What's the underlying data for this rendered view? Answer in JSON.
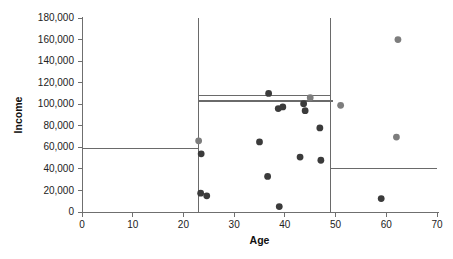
{
  "chart_data": {
    "type": "scatter",
    "title": "",
    "xlabel": "Age",
    "ylabel": "Income",
    "xlim": [
      0,
      70
    ],
    "ylim": [
      0,
      180000
    ],
    "xticks": [
      0,
      10,
      20,
      30,
      40,
      50,
      60,
      70
    ],
    "xticklabels": [
      "0",
      "10",
      "20",
      "30",
      "40",
      "50",
      "60",
      "70"
    ],
    "yticks": [
      0,
      20000,
      40000,
      60000,
      80000,
      100000,
      120000,
      140000,
      160000,
      180000
    ],
    "yticklabels": [
      "0",
      "20,000",
      "40,000",
      "60,000",
      "80,000",
      "100,000",
      "120,000",
      "140,000",
      "160,000",
      "180,000"
    ],
    "grid": false,
    "legend": null,
    "series": [
      {
        "name": "dark-points",
        "color": "#3b3b3b",
        "marker": "circle",
        "points": [
          {
            "x": 23.5,
            "y": 54000
          },
          {
            "x": 23.4,
            "y": 17500
          },
          {
            "x": 24.6,
            "y": 15000
          },
          {
            "x": 35.0,
            "y": 65000
          },
          {
            "x": 36.6,
            "y": 33000
          },
          {
            "x": 36.8,
            "y": 110000
          },
          {
            "x": 38.9,
            "y": 5000
          },
          {
            "x": 38.7,
            "y": 96000
          },
          {
            "x": 39.6,
            "y": 97500
          },
          {
            "x": 43.0,
            "y": 51000
          },
          {
            "x": 43.7,
            "y": 100500
          },
          {
            "x": 44.0,
            "y": 94000
          },
          {
            "x": 46.9,
            "y": 78000
          },
          {
            "x": 47.1,
            "y": 48000
          },
          {
            "x": 59.0,
            "y": 12500
          }
        ]
      },
      {
        "name": "gray-points",
        "color": "#7d7d7d",
        "marker": "circle",
        "points": [
          {
            "x": 23.0,
            "y": 66000
          },
          {
            "x": 45.0,
            "y": 106000
          },
          {
            "x": 51.0,
            "y": 99000
          },
          {
            "x": 62.3,
            "y": 160000
          },
          {
            "x": 62.0,
            "y": 69500
          }
        ]
      }
    ],
    "annotations": {
      "vertical_splits": [
        {
          "name": "split-age-23",
          "x": 23.0,
          "y_from": 0,
          "y_to": 180000
        },
        {
          "name": "split-age-49",
          "x": 49.0,
          "y_from": 0,
          "y_to": 180000
        }
      ],
      "horizontal_splits": [
        {
          "name": "segment-left-59k",
          "y": 59000,
          "x_from": 0,
          "x_to": 23.0
        },
        {
          "name": "segment-mid-108k",
          "y": 108000,
          "x_from": 23.0,
          "x_to": 49.0
        },
        {
          "name": "segment-mid-103k",
          "y": 103000,
          "x_from": 23.0,
          "x_to": 49.5
        },
        {
          "name": "segment-right-40k",
          "y": 40000,
          "x_from": 49.0,
          "x_to": 70.0
        }
      ]
    }
  }
}
